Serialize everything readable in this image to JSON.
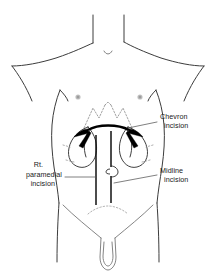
{
  "figure": {
    "background_color": "#ffffff",
    "line_color": "#3c3c3c",
    "incision_color": "#000000",
    "leader_color": "#555555"
  },
  "labels": [
    {
      "id": "chevron",
      "name": "chevron-incision-label",
      "lines": [
        "Chevron",
        "incision"
      ],
      "align": "left",
      "x": 160,
      "y": 119,
      "leader_from": [
        157,
        122
      ],
      "leader_to": [
        128,
        128
      ]
    },
    {
      "id": "midline",
      "name": "midline-incision-label",
      "lines": [
        "Midline",
        "incision"
      ],
      "align": "left",
      "x": 160,
      "y": 173,
      "leader_from": [
        157,
        175
      ],
      "leader_to": [
        114,
        183
      ]
    },
    {
      "id": "paramedian",
      "name": "rt-paramedial-incision-label",
      "lines": [
        "Rt.",
        "paramedial",
        "incision"
      ],
      "align": "right",
      "x": 62,
      "y": 167,
      "leader_from": [
        65,
        177
      ],
      "leader_to": [
        96,
        177
      ]
    }
  ],
  "anatomy": {
    "nipples": [
      {
        "name": "left-nipple",
        "cx": 78,
        "cy": 97
      },
      {
        "name": "right-nipple",
        "cx": 140,
        "cy": 97
      }
    ],
    "umbilicus": {
      "name": "umbilicus",
      "cx": 107,
      "cy": 171,
      "r": 5.2
    },
    "sternal_notch": {
      "name": "sternal-notch",
      "cx": 108,
      "cy": 52
    },
    "organs": [
      "left-kidney-outline",
      "right-kidney-outline"
    ],
    "costal_margin": "rib-margin-dotted"
  },
  "incisions": [
    {
      "name": "chevron-incision",
      "type": "curved-bilateral-subcostal",
      "style": "bold-arc-with-arrow-wings"
    },
    {
      "name": "midline-incision",
      "type": "vertical-midline",
      "x": 111,
      "y_top": 131,
      "y_bottom": 203
    },
    {
      "name": "rt-paramedian-incision",
      "type": "vertical-paramedian",
      "x": 96,
      "y_top": 135,
      "y_bottom": 205
    }
  ]
}
